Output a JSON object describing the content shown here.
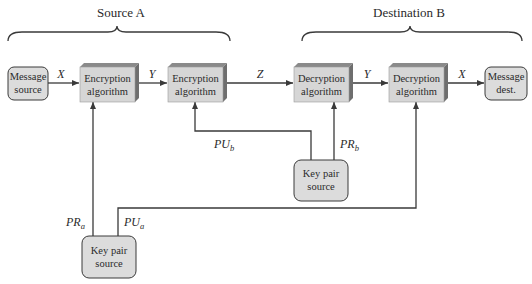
{
  "groups": {
    "source": "Source A",
    "destination": "Destination B"
  },
  "nodes": {
    "message_source": [
      "Message",
      "source"
    ],
    "enc1": [
      "Encryption",
      "algorithm"
    ],
    "enc2": [
      "Encryption",
      "algorithm"
    ],
    "dec1": [
      "Decryption",
      "algorithm"
    ],
    "dec2": [
      "Decryption",
      "algorithm"
    ],
    "message_dest": [
      "Message",
      "dest."
    ],
    "keypair_a": [
      "Key pair",
      "source"
    ],
    "keypair_b": [
      "Key pair",
      "source"
    ]
  },
  "edges": {
    "x1": "X",
    "y1": "Y",
    "z": "Z",
    "y2": "Y",
    "x2": "X",
    "pu_b": {
      "base": "PU",
      "sub": "b"
    },
    "pr_b": {
      "base": "PR",
      "sub": "b"
    },
    "pr_a": {
      "base": "PR",
      "sub": "a"
    },
    "pu_a": {
      "base": "PU",
      "sub": "a"
    }
  },
  "colors": {
    "box_front": "#d6d6d6",
    "box_top": "#8a8a8a",
    "box_side": "#6e6e6e",
    "rounded_fill": "#dcdcdc",
    "stroke": "#3a3a3a"
  }
}
